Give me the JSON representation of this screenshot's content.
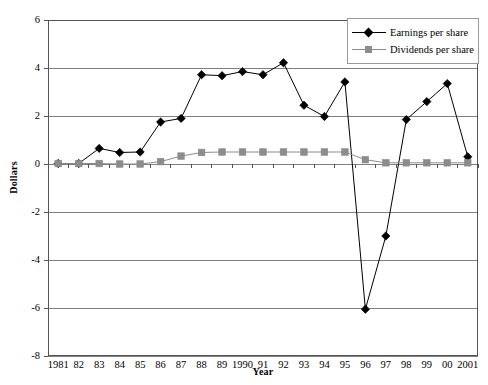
{
  "chart_data": {
    "type": "line",
    "title": "",
    "xlabel": "Year",
    "ylabel": "Dollars",
    "ylim": [
      -8,
      6
    ],
    "y_ticks": [
      6,
      4,
      2,
      0,
      -2,
      -4,
      -6,
      -8
    ],
    "y_tick_labels": [
      "6",
      "4",
      "2",
      "0",
      "-2",
      "-4",
      "-6",
      "-8"
    ],
    "grid": true,
    "legend_position": "top-right",
    "categories": [
      "1981",
      "82",
      "83",
      "84",
      "85",
      "86",
      "87",
      "88",
      "89",
      "1990",
      "91",
      "92",
      "93",
      "94",
      "95",
      "96",
      "97",
      "98",
      "99",
      "00",
      "2001"
    ],
    "series": [
      {
        "name": "Earnings per share",
        "marker": "diamond",
        "color": "#000000",
        "values": [
          0.02,
          0.02,
          0.65,
          0.48,
          0.5,
          1.75,
          1.9,
          3.72,
          3.68,
          3.85,
          3.72,
          4.22,
          2.45,
          1.98,
          3.42,
          -6.05,
          -3.0,
          1.85,
          2.6,
          3.35,
          0.3
        ]
      },
      {
        "name": "Dividends per share",
        "marker": "square",
        "color": "#8c8c8c",
        "values": [
          0.02,
          0.02,
          0.02,
          0.0,
          0.0,
          0.1,
          0.33,
          0.48,
          0.5,
          0.5,
          0.5,
          0.5,
          0.5,
          0.5,
          0.5,
          0.18,
          0.05,
          0.05,
          0.05,
          0.05,
          0.05
        ]
      }
    ]
  },
  "legend": {
    "items": [
      {
        "label": "Earnings per share",
        "marker": "diamond-icon",
        "color": "#000000"
      },
      {
        "label": "Dividends per share",
        "marker": "square-icon",
        "color": "#8c8c8c"
      }
    ]
  },
  "axes": {
    "y_title": "Dollars",
    "x_title": "Year"
  },
  "colors": {
    "earnings": "#000000",
    "dividends": "#8c8c8c",
    "gridline": "#808080",
    "axis": "#555555",
    "background": "#ffffff"
  }
}
